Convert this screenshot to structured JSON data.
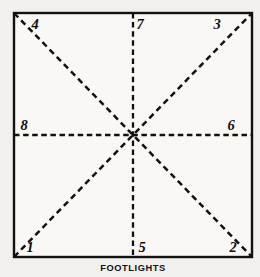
{
  "diagram": {
    "background_color": "#f2f0ec",
    "stage_fill": "#faf8f5",
    "ink_color": "#111111",
    "stage": {
      "left": 14,
      "top": 13,
      "right": 252,
      "bottom": 257,
      "center_x": 133,
      "center_y": 135
    },
    "lines": [
      {
        "name": "vertical-center-line",
        "style": "dashed",
        "x1": 133,
        "y1": 13,
        "x2": 133,
        "y2": 257
      },
      {
        "name": "horizontal-center-line",
        "style": "dashed",
        "x1": 14,
        "y1": 135,
        "x2": 252,
        "y2": 135
      },
      {
        "name": "diagonal-upleft-to-downright",
        "style": "dashed",
        "x1": 14,
        "y1": 13,
        "x2": 252,
        "y2": 257
      },
      {
        "name": "diagonal-downleft-to-upright",
        "style": "dashed",
        "x1": 14,
        "y1": 257,
        "x2": 252,
        "y2": 13
      }
    ],
    "positions": [
      {
        "id": "position-1",
        "label": "1",
        "x": 30,
        "y": 252,
        "anchor": "middle"
      },
      {
        "id": "position-2",
        "label": "2",
        "x": 233,
        "y": 252,
        "anchor": "middle"
      },
      {
        "id": "position-3",
        "label": "3",
        "x": 217,
        "y": 29,
        "anchor": "middle"
      },
      {
        "id": "position-4",
        "label": "4",
        "x": 35,
        "y": 29,
        "anchor": "middle"
      },
      {
        "id": "position-5",
        "label": "5",
        "x": 142,
        "y": 252,
        "anchor": "middle"
      },
      {
        "id": "position-6",
        "label": "6",
        "x": 231,
        "y": 130,
        "anchor": "middle"
      },
      {
        "id": "position-7",
        "label": "7",
        "x": 140,
        "y": 29,
        "anchor": "middle"
      },
      {
        "id": "position-8",
        "label": "8",
        "x": 24,
        "y": 130,
        "anchor": "middle"
      }
    ],
    "footlights": {
      "label": "FOOTLIGHTS",
      "x": 133,
      "y": 271
    }
  }
}
